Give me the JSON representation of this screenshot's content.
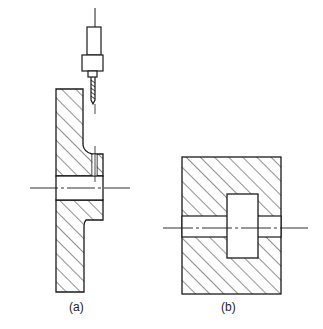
{
  "figure": {
    "labels": {
      "a": "(a)",
      "b": "(b)"
    },
    "line_color": "#1a1a1a",
    "background": "#ffffff"
  }
}
